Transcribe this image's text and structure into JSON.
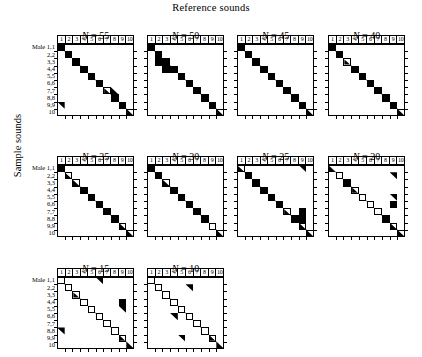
{
  "figure": {
    "top_axis_title": "Reference sounds",
    "left_axis_title": "Sample sounds",
    "row_label_prefix": "Male",
    "column_headers": [
      "1",
      "2",
      "3",
      "4",
      "5",
      "6",
      "7",
      "8",
      "9",
      "10"
    ],
    "row_labels": [
      "1,1",
      "2,2",
      "3,3",
      "4,4",
      "5,5",
      "6,6",
      "7,7",
      "8,8",
      "9,9",
      "10"
    ],
    "n_rows": 10,
    "n_cols": 10,
    "ink_color": "#000000",
    "paper_color": "#ffffff"
  },
  "chart_data": {
    "type": "heatmap",
    "title": "Reference sounds",
    "xlabel": "Reference sounds",
    "ylabel": "Sample sounds",
    "grid": true,
    "legend": "none",
    "cell_states": {
      "full": "filled black square (strong match)",
      "open": "outlined empty square (weak/no match)",
      "tri-bl": "lower-left black triangle (partial match)",
      "tri-tr": "upper-right black triangle (partial match)",
      "half-open-tri": "outlined square with lower-left black triangle",
      "half-open-tr": "outlined square with upper-right black triangle"
    },
    "categories": [
      "1",
      "2",
      "3",
      "4",
      "5",
      "6",
      "7",
      "8",
      "9",
      "10"
    ],
    "rows": [
      "1,1",
      "2,2",
      "3,3",
      "4,4",
      "5,5",
      "6,6",
      "7,7",
      "8,8",
      "9,9",
      "10"
    ],
    "panels": [
      {
        "label_prefix": "N",
        "label_value": "55",
        "title": "N = 55",
        "cells": [
          {
            "r": 0,
            "c": 0,
            "state": "full"
          },
          {
            "r": 1,
            "c": 1,
            "state": "full"
          },
          {
            "r": 2,
            "c": 2,
            "state": "full"
          },
          {
            "r": 3,
            "c": 3,
            "state": "full"
          },
          {
            "r": 4,
            "c": 4,
            "state": "full"
          },
          {
            "r": 5,
            "c": 5,
            "state": "full"
          },
          {
            "r": 6,
            "c": 6,
            "state": "half-open-tri"
          },
          {
            "r": 6,
            "c": 7,
            "state": "tri-bl"
          },
          {
            "r": 7,
            "c": 7,
            "state": "full"
          },
          {
            "r": 8,
            "c": 8,
            "state": "full"
          },
          {
            "r": 9,
            "c": 9,
            "state": "open"
          },
          {
            "r": 8,
            "c": 0,
            "state": "tri-tr"
          },
          {
            "r": 9,
            "c": 9,
            "state": "tri-bl"
          }
        ]
      },
      {
        "label_prefix": "N",
        "label_value": "50",
        "title": "N = 50",
        "cells": [
          {
            "r": 0,
            "c": 0,
            "state": "full"
          },
          {
            "r": 1,
            "c": 1,
            "state": "full"
          },
          {
            "r": 2,
            "c": 1,
            "state": "full"
          },
          {
            "r": 2,
            "c": 2,
            "state": "full"
          },
          {
            "r": 3,
            "c": 2,
            "state": "full"
          },
          {
            "r": 3,
            "c": 3,
            "state": "full"
          },
          {
            "r": 4,
            "c": 4,
            "state": "full"
          },
          {
            "r": 5,
            "c": 5,
            "state": "full"
          },
          {
            "r": 6,
            "c": 6,
            "state": "full"
          },
          {
            "r": 7,
            "c": 7,
            "state": "full"
          },
          {
            "r": 8,
            "c": 8,
            "state": "full"
          },
          {
            "r": 9,
            "c": 9,
            "state": "open"
          },
          {
            "r": 9,
            "c": 9,
            "state": "tri-bl"
          }
        ]
      },
      {
        "label_prefix": "N",
        "label_value": "45",
        "title": "N = 45",
        "cells": [
          {
            "r": 0,
            "c": 0,
            "state": "full"
          },
          {
            "r": 1,
            "c": 1,
            "state": "full"
          },
          {
            "r": 2,
            "c": 2,
            "state": "full"
          },
          {
            "r": 3,
            "c": 3,
            "state": "full"
          },
          {
            "r": 4,
            "c": 4,
            "state": "full"
          },
          {
            "r": 5,
            "c": 5,
            "state": "full"
          },
          {
            "r": 6,
            "c": 6,
            "state": "full"
          },
          {
            "r": 7,
            "c": 7,
            "state": "full"
          },
          {
            "r": 8,
            "c": 8,
            "state": "full"
          },
          {
            "r": 9,
            "c": 9,
            "state": "open"
          },
          {
            "r": 9,
            "c": 9,
            "state": "tri-bl"
          }
        ]
      },
      {
        "label_prefix": "N",
        "label_value": "40",
        "title": "N = 40",
        "cells": [
          {
            "r": 0,
            "c": 0,
            "state": "full"
          },
          {
            "r": 1,
            "c": 1,
            "state": "full"
          },
          {
            "r": 2,
            "c": 2,
            "state": "half-open-tri"
          },
          {
            "r": 3,
            "c": 3,
            "state": "full"
          },
          {
            "r": 4,
            "c": 4,
            "state": "full"
          },
          {
            "r": 5,
            "c": 5,
            "state": "full"
          },
          {
            "r": 6,
            "c": 6,
            "state": "full"
          },
          {
            "r": 7,
            "c": 7,
            "state": "full"
          },
          {
            "r": 8,
            "c": 8,
            "state": "full"
          },
          {
            "r": 9,
            "c": 9,
            "state": "open"
          },
          {
            "r": 9,
            "c": 9,
            "state": "tri-bl"
          }
        ]
      },
      {
        "label_prefix": "N",
        "label_value": "35",
        "title": "N = 35",
        "cells": [
          {
            "r": 0,
            "c": 0,
            "state": "full"
          },
          {
            "r": 1,
            "c": 1,
            "state": "half-open-tri"
          },
          {
            "r": 2,
            "c": 2,
            "state": "open"
          },
          {
            "r": 3,
            "c": 3,
            "state": "full"
          },
          {
            "r": 4,
            "c": 4,
            "state": "full"
          },
          {
            "r": 5,
            "c": 5,
            "state": "full"
          },
          {
            "r": 6,
            "c": 6,
            "state": "full"
          },
          {
            "r": 7,
            "c": 7,
            "state": "full"
          },
          {
            "r": 8,
            "c": 8,
            "state": "open"
          },
          {
            "r": 9,
            "c": 9,
            "state": "open"
          },
          {
            "r": 2,
            "c": 2,
            "state": "tri-bl"
          },
          {
            "r": 8,
            "c": 8,
            "state": "tri-bl"
          },
          {
            "r": 9,
            "c": 9,
            "state": "tri-bl"
          }
        ]
      },
      {
        "label_prefix": "N",
        "label_value": "30",
        "title": "N = 30",
        "cells": [
          {
            "r": 0,
            "c": 0,
            "state": "full"
          },
          {
            "r": 1,
            "c": 1,
            "state": "full"
          },
          {
            "r": 2,
            "c": 2,
            "state": "open"
          },
          {
            "r": 3,
            "c": 3,
            "state": "full"
          },
          {
            "r": 4,
            "c": 4,
            "state": "full"
          },
          {
            "r": 5,
            "c": 5,
            "state": "full"
          },
          {
            "r": 6,
            "c": 6,
            "state": "full"
          },
          {
            "r": 7,
            "c": 7,
            "state": "full"
          },
          {
            "r": 8,
            "c": 8,
            "state": "open"
          },
          {
            "r": 9,
            "c": 9,
            "state": "open"
          },
          {
            "r": 2,
            "c": 2,
            "state": "tri-bl"
          },
          {
            "r": 9,
            "c": 9,
            "state": "tri-bl"
          }
        ]
      },
      {
        "label_prefix": "N",
        "label_value": "25",
        "title": "N = 25",
        "cells": [
          {
            "r": 0,
            "c": 0,
            "state": "half-open-tri"
          },
          {
            "r": 0,
            "c": 8,
            "state": "tri-tr"
          },
          {
            "r": 1,
            "c": 1,
            "state": "full"
          },
          {
            "r": 2,
            "c": 2,
            "state": "full"
          },
          {
            "r": 3,
            "c": 3,
            "state": "full"
          },
          {
            "r": 4,
            "c": 4,
            "state": "full"
          },
          {
            "r": 5,
            "c": 5,
            "state": "full"
          },
          {
            "r": 6,
            "c": 6,
            "state": "half-open-tri"
          },
          {
            "r": 6,
            "c": 8,
            "state": "full"
          },
          {
            "r": 7,
            "c": 7,
            "state": "full"
          },
          {
            "r": 7,
            "c": 8,
            "state": "full"
          },
          {
            "r": 8,
            "c": 8,
            "state": "open"
          },
          {
            "r": 9,
            "c": 9,
            "state": "open"
          },
          {
            "r": 8,
            "c": 8,
            "state": "tri-bl"
          },
          {
            "r": 9,
            "c": 9,
            "state": "tri-bl"
          }
        ]
      },
      {
        "label_prefix": "N",
        "label_value": "20",
        "title": "N = 20",
        "cells": [
          {
            "r": 0,
            "c": 0,
            "state": "tri-bl"
          },
          {
            "r": 1,
            "c": 1,
            "state": "open"
          },
          {
            "r": 1,
            "c": 8,
            "state": "tri-tr"
          },
          {
            "r": 2,
            "c": 2,
            "state": "full"
          },
          {
            "r": 3,
            "c": 3,
            "state": "half-open-tri"
          },
          {
            "r": 4,
            "c": 4,
            "state": "open"
          },
          {
            "r": 4,
            "c": 8,
            "state": "tri-tr"
          },
          {
            "r": 5,
            "c": 5,
            "state": "open"
          },
          {
            "r": 5,
            "c": 8,
            "state": "full"
          },
          {
            "r": 6,
            "c": 6,
            "state": "open"
          },
          {
            "r": 7,
            "c": 7,
            "state": "full"
          },
          {
            "r": 8,
            "c": 8,
            "state": "open"
          },
          {
            "r": 9,
            "c": 9,
            "state": "open"
          },
          {
            "r": 8,
            "c": 8,
            "state": "tri-bl"
          },
          {
            "r": 9,
            "c": 9,
            "state": "tri-bl"
          }
        ]
      },
      {
        "label_prefix": "N",
        "label_value": "15",
        "title": "N = 15",
        "cells": [
          {
            "r": 0,
            "c": 0,
            "state": "open"
          },
          {
            "r": 0,
            "c": 5,
            "state": "tri-tr"
          },
          {
            "r": 1,
            "c": 1,
            "state": "open"
          },
          {
            "r": 2,
            "c": 2,
            "state": "half-open-tri"
          },
          {
            "r": 3,
            "c": 3,
            "state": "open"
          },
          {
            "r": 3,
            "c": 8,
            "state": "full"
          },
          {
            "r": 4,
            "c": 4,
            "state": "open"
          },
          {
            "r": 4,
            "c": 8,
            "state": "tri-tr"
          },
          {
            "r": 5,
            "c": 5,
            "state": "open"
          },
          {
            "r": 6,
            "c": 6,
            "state": "open"
          },
          {
            "r": 7,
            "c": 7,
            "state": "open"
          },
          {
            "r": 7,
            "c": 0,
            "state": "tri-tr"
          },
          {
            "r": 8,
            "c": 8,
            "state": "half-open-tri"
          },
          {
            "r": 9,
            "c": 9,
            "state": "tri-bl"
          }
        ]
      },
      {
        "label_prefix": "N",
        "label_value": "10",
        "title": "N = 10",
        "cells": [
          {
            "r": 0,
            "c": 0,
            "state": "open"
          },
          {
            "r": 1,
            "c": 1,
            "state": "open"
          },
          {
            "r": 1,
            "c": 5,
            "state": "tri-tr"
          },
          {
            "r": 2,
            "c": 2,
            "state": "open"
          },
          {
            "r": 3,
            "c": 3,
            "state": "open"
          },
          {
            "r": 4,
            "c": 4,
            "state": "open"
          },
          {
            "r": 5,
            "c": 5,
            "state": "open"
          },
          {
            "r": 5,
            "c": 3,
            "state": "tri-tr"
          },
          {
            "r": 6,
            "c": 6,
            "state": "open"
          },
          {
            "r": 7,
            "c": 7,
            "state": "open"
          },
          {
            "r": 8,
            "c": 8,
            "state": "half-open-tri"
          },
          {
            "r": 8,
            "c": 4,
            "state": "tri-tr"
          },
          {
            "r": 9,
            "c": 9,
            "state": "tri-bl"
          }
        ]
      }
    ]
  }
}
